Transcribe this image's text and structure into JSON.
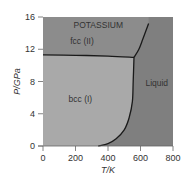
{
  "chart_data": {
    "type": "area",
    "title": "POTASSIUM",
    "xlabel": "T/K",
    "ylabel": "P/GPa",
    "xlim": [
      0,
      800
    ],
    "ylim": [
      0,
      16
    ],
    "x_ticks": [
      "0",
      "200",
      "400",
      "600",
      "800"
    ],
    "y_ticks": [
      "0",
      "4",
      "8",
      "12",
      "16"
    ],
    "grid": false,
    "legend": null,
    "regions": [
      {
        "name": "fcc (II)",
        "label_pos": [
          240,
          12.6
        ],
        "color": "#8c8c8c"
      },
      {
        "name": "bcc (I)",
        "label_pos": [
          230,
          5.5
        ],
        "color": "#a9a9a9"
      },
      {
        "name": "Liquid",
        "label_pos": [
          700,
          7.5
        ],
        "color": "#7f7f7f"
      }
    ],
    "boundaries": [
      {
        "name": "fcc-bcc",
        "points": [
          [
            0,
            11.3
          ],
          [
            200,
            11.25
          ],
          [
            400,
            11.15
          ],
          [
            560,
            11.0
          ]
        ]
      },
      {
        "name": "bcc-liquid (melting)",
        "points": [
          [
            340,
            0
          ],
          [
            400,
            0.3
          ],
          [
            450,
            0.9
          ],
          [
            500,
            2.0
          ],
          [
            530,
            3.5
          ],
          [
            550,
            5.5
          ],
          [
            555,
            8
          ],
          [
            560,
            11.0
          ]
        ]
      },
      {
        "name": "fcc-liquid (melting)",
        "points": [
          [
            560,
            11.0
          ],
          [
            590,
            12.0
          ],
          [
            615,
            13.3
          ],
          [
            650,
            15.2
          ]
        ]
      }
    ],
    "triple_point": [
      560,
      11.0
    ]
  }
}
